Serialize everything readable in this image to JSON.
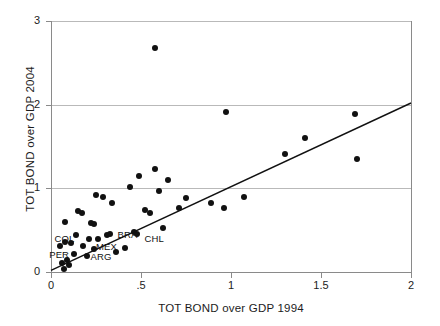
{
  "chart_data": {
    "type": "scatter",
    "title": "",
    "xlabel": "TOT BOND over GDP 1994",
    "ylabel": "TOT BOND over GDP 2004",
    "xlim": [
      0,
      2
    ],
    "ylim": [
      0,
      3
    ],
    "xticks": [
      0,
      0.5,
      1,
      1.5,
      2
    ],
    "xtick_labels": [
      "0",
      ".5",
      "1",
      "1.5",
      "2"
    ],
    "yticks": [
      0,
      1,
      2,
      3
    ],
    "ytick_labels": [
      "0",
      "1",
      "2",
      "3"
    ],
    "grid": "horizontal gridlines at y = 1, 2, 3",
    "legend": "none",
    "marker": "filled black circle",
    "points": [
      {
        "x": 0.58,
        "y": 2.68,
        "label": ""
      },
      {
        "x": 0.97,
        "y": 1.91,
        "label": ""
      },
      {
        "x": 1.69,
        "y": 1.89,
        "label": ""
      },
      {
        "x": 1.41,
        "y": 1.6,
        "label": ""
      },
      {
        "x": 1.3,
        "y": 1.41,
        "label": ""
      },
      {
        "x": 1.7,
        "y": 1.35,
        "label": ""
      },
      {
        "x": 0.58,
        "y": 1.23,
        "label": ""
      },
      {
        "x": 0.49,
        "y": 1.15,
        "label": ""
      },
      {
        "x": 0.65,
        "y": 1.1,
        "label": ""
      },
      {
        "x": 0.44,
        "y": 1.02,
        "label": ""
      },
      {
        "x": 0.6,
        "y": 0.97,
        "label": ""
      },
      {
        "x": 1.07,
        "y": 0.9,
        "label": ""
      },
      {
        "x": 0.75,
        "y": 0.89,
        "label": ""
      },
      {
        "x": 0.25,
        "y": 0.92,
        "label": ""
      },
      {
        "x": 0.29,
        "y": 0.9,
        "label": ""
      },
      {
        "x": 0.34,
        "y": 0.82,
        "label": ""
      },
      {
        "x": 0.89,
        "y": 0.83,
        "label": ""
      },
      {
        "x": 0.96,
        "y": 0.77,
        "label": ""
      },
      {
        "x": 0.71,
        "y": 0.76,
        "label": ""
      },
      {
        "x": 0.52,
        "y": 0.74,
        "label": ""
      },
      {
        "x": 0.55,
        "y": 0.71,
        "label": ""
      },
      {
        "x": 0.15,
        "y": 0.73,
        "label": ""
      },
      {
        "x": 0.17,
        "y": 0.7,
        "label": ""
      },
      {
        "x": 0.22,
        "y": 0.59,
        "label": ""
      },
      {
        "x": 0.24,
        "y": 0.57,
        "label": ""
      },
      {
        "x": 0.08,
        "y": 0.6,
        "label": ""
      },
      {
        "x": 0.62,
        "y": 0.52,
        "label": ""
      },
      {
        "x": 0.31,
        "y": 0.44,
        "label": "BRA"
      },
      {
        "x": 0.33,
        "y": 0.46,
        "label": ""
      },
      {
        "x": 0.14,
        "y": 0.44,
        "label": ""
      },
      {
        "x": 0.21,
        "y": 0.4,
        "label": ""
      },
      {
        "x": 0.26,
        "y": 0.39,
        "label": ""
      },
      {
        "x": 0.08,
        "y": 0.36,
        "label": "COL"
      },
      {
        "x": 0.11,
        "y": 0.35,
        "label": ""
      },
      {
        "x": 0.05,
        "y": 0.31,
        "label": ""
      },
      {
        "x": 0.18,
        "y": 0.31,
        "label": ""
      },
      {
        "x": 0.24,
        "y": 0.27,
        "label": "MEX"
      },
      {
        "x": 0.46,
        "y": 0.48,
        "label": "CHL"
      },
      {
        "x": 0.48,
        "y": 0.45,
        "label": ""
      },
      {
        "x": 0.41,
        "y": 0.29,
        "label": ""
      },
      {
        "x": 0.36,
        "y": 0.24,
        "label": ""
      },
      {
        "x": 0.13,
        "y": 0.22,
        "label": ""
      },
      {
        "x": 0.2,
        "y": 0.19,
        "label": "ARG"
      },
      {
        "x": 0.09,
        "y": 0.14,
        "label": ""
      },
      {
        "x": 0.06,
        "y": 0.11,
        "label": "PER"
      },
      {
        "x": 0.1,
        "y": 0.08,
        "label": ""
      },
      {
        "x": 0.07,
        "y": 0.04,
        "label": ""
      }
    ],
    "trend_line": {
      "x_start": 0.0,
      "y_start": 0.02,
      "x_end": 2.0,
      "y_end": 2.02,
      "color": "#111111"
    },
    "annotations": [
      {
        "text": "BRA",
        "x": 0.37,
        "y": 0.44
      },
      {
        "text": "CHL",
        "x": 0.52,
        "y": 0.4
      },
      {
        "text": "COL",
        "x": 0.02,
        "y": 0.4
      },
      {
        "text": "MEX",
        "x": 0.25,
        "y": 0.3
      },
      {
        "text": "PER",
        "x": -0.01,
        "y": 0.2
      },
      {
        "text": "ARG",
        "x": 0.22,
        "y": 0.18
      }
    ]
  }
}
